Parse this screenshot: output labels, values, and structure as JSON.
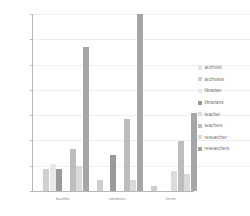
{
  "chart_data": {
    "type": "bar",
    "title": "",
    "xlabel": "",
    "ylabel": "",
    "categories": [
      "bauftler",
      "nambuns",
      "hnnm"
    ],
    "ylim": [
      0,
      0.07
    ],
    "grid": true,
    "legend_position": "right",
    "ytick_labels": [
      "0.07",
      "0.06",
      "0.05",
      "0.04",
      "0.03",
      "0.02",
      "0.01",
      "0"
    ],
    "ytick_values": [
      0.07,
      0.06,
      0.05,
      0.04,
      0.03,
      0.02,
      0.01,
      0
    ],
    "series": [
      {
        "name": "archivist",
        "color": "#e2e2e2",
        "values": [
          0.0,
          0.0,
          0.0
        ]
      },
      {
        "name": "archivists",
        "color": "#cfcfcf",
        "values": [
          0.0086,
          0.0045,
          0.0018
        ]
      },
      {
        "name": "librarian",
        "color": "#e8e8e8",
        "values": [
          0.0105,
          0.0,
          0.0
        ]
      },
      {
        "name": "librarians",
        "color": "#9a9a9a",
        "values": [
          0.0086,
          0.0143,
          0.0
        ]
      },
      {
        "name": "teacher",
        "color": "#dcdcdc",
        "values": [
          0.0,
          0.0,
          0.0078
        ]
      },
      {
        "name": "teachers",
        "color": "#bdbdbd",
        "values": [
          0.0168,
          0.0285,
          0.0196
        ]
      },
      {
        "name": "researcher",
        "color": "#dadada",
        "values": [
          0.01,
          0.0045,
          0.0069
        ]
      },
      {
        "name": "researchers",
        "color": "#a6a6a6",
        "values": [
          0.057,
          0.07,
          0.031
        ]
      }
    ]
  },
  "legend": {
    "items": [
      {
        "label": "archivist"
      },
      {
        "label": "archivists"
      },
      {
        "label": "librarian"
      },
      {
        "label": "librarians"
      },
      {
        "label": "teacher"
      },
      {
        "label": "teachers"
      },
      {
        "label": "researcher"
      },
      {
        "label": "researchers"
      }
    ]
  }
}
